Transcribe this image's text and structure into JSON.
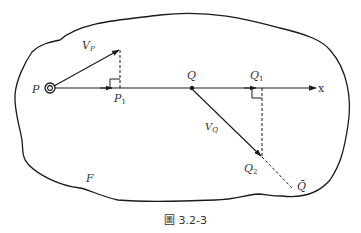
{
  "figure": {
    "caption": "圖 3.2-3",
    "region_label": "F",
    "axis_label": "x",
    "points": {
      "P": {
        "label": "P"
      },
      "P1": {
        "label": "P",
        "sub": "1"
      },
      "Q": {
        "label": "Q"
      },
      "Q1": {
        "label": "Q",
        "sub": "1"
      },
      "Q2": {
        "label": "Q",
        "sub": "2"
      },
      "Qbar": {
        "label": "Q̄"
      }
    },
    "vectors": {
      "VP": {
        "label": "V",
        "sub": "P"
      },
      "VQ": {
        "label": "V",
        "sub": "Q"
      }
    },
    "colors": {
      "stroke": "#1a1a1a",
      "text": "#333333"
    }
  }
}
